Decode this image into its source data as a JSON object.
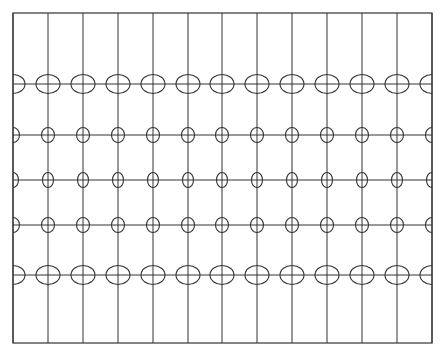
{
  "diagram": {
    "type": "tissot-indicatrix-grid",
    "frame": {
      "x": 13,
      "y": 13,
      "width": 419,
      "height": 330
    },
    "stroke_color": "#333333",
    "background": "#ffffff",
    "meridians_x": [
      13,
      48,
      83,
      118,
      153,
      188,
      222,
      257,
      292,
      327,
      362,
      397,
      432
    ],
    "parallels": [
      {
        "y": 84,
        "ellipse_rx": 12,
        "ellipse_ry": 9.5
      },
      {
        "y": 135,
        "ellipse_rx": 6.5,
        "ellipse_ry": 7.5
      },
      {
        "y": 180,
        "ellipse_rx": 5.5,
        "ellipse_ry": 7.5
      },
      {
        "y": 225,
        "ellipse_rx": 6.5,
        "ellipse_ry": 7.5
      },
      {
        "y": 275,
        "ellipse_rx": 12,
        "ellipse_ry": 9.5
      }
    ]
  }
}
